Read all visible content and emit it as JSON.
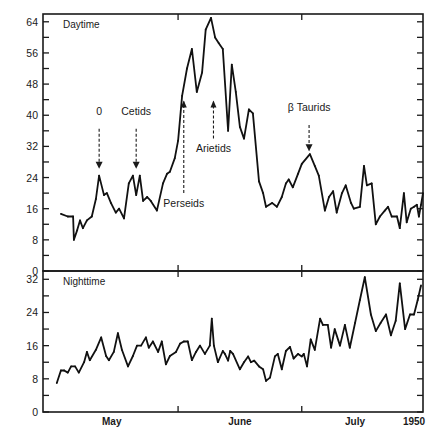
{
  "chart_data": [
    {
      "type": "line",
      "panel": "top",
      "title": "Daytime",
      "xlabel": "",
      "ylabel": "",
      "x_unit": "days from axis start",
      "xlim": [
        0,
        93.4
      ],
      "ylim": [
        0,
        66
      ],
      "yticks": [
        0,
        4,
        8,
        12,
        16,
        20,
        24,
        28,
        32,
        36,
        40,
        44,
        48,
        52,
        56,
        60,
        64
      ],
      "ytick_labels": [
        "0",
        "8",
        "16",
        "24",
        "32",
        "40",
        "48",
        "56",
        "64"
      ],
      "ytick_label_values": [
        0,
        8,
        16,
        24,
        32,
        40,
        48,
        56,
        64
      ],
      "month_ticks": [
        33.2,
        63.6
      ],
      "series": [
        {
          "name": "Daytime",
          "x": [
            4.4,
            6.1,
            7.4,
            7.6,
            8.4,
            9.1,
            9.8,
            10.8,
            12.0,
            13.0,
            13.8,
            15.0,
            15.7,
            16.7,
            17.9,
            18.7,
            19.9,
            21.1,
            22.1,
            22.9,
            23.8,
            24.6,
            25.6,
            26.5,
            28.0,
            29.5,
            30.5,
            31.2,
            32.4,
            33.2,
            34.2,
            35.4,
            36.6,
            37.8,
            39.1,
            40.0,
            41.3,
            42.3,
            43.2,
            44.2,
            45.5,
            46.4,
            47.4,
            48.4,
            49.4,
            50.6,
            51.6,
            53.1,
            54.1,
            54.8,
            56.3,
            57.5,
            58.7,
            59.7,
            60.4,
            61.4,
            62.7,
            63.6,
            65.6,
            66.8,
            67.8,
            69.3,
            70.3,
            71.3,
            72.2,
            73.5,
            74.4,
            75.7,
            76.4,
            77.9,
            78.9,
            79.6,
            80.8,
            81.8,
            82.8,
            84.0,
            84.8,
            85.7,
            87.0,
            87.7,
            88.7,
            89.4,
            90.4,
            91.2,
            91.9,
            92.4,
            92.9,
            93.4
          ],
          "values": [
            14.7,
            14,
            14,
            8,
            10.5,
            13,
            11,
            13,
            14,
            18.5,
            24.5,
            19.5,
            20,
            17.5,
            15,
            16,
            13.5,
            22.5,
            24.5,
            19.5,
            24.5,
            18,
            19,
            18,
            15.5,
            22.5,
            25,
            25.5,
            29,
            33.5,
            45,
            52,
            57,
            46,
            51,
            62,
            65,
            60,
            58.5,
            57,
            36,
            53,
            46,
            37,
            34,
            41.5,
            40.5,
            23,
            20,
            16.5,
            17.5,
            16.5,
            19,
            22.5,
            23.5,
            21.5,
            25,
            27.5,
            30,
            27,
            24.5,
            15.5,
            19,
            20.5,
            15,
            20,
            22,
            17.5,
            16,
            16.5,
            27,
            22,
            22.5,
            12,
            14,
            15.5,
            16.5,
            14,
            14,
            11,
            20,
            12.5,
            16,
            16.5,
            17,
            14,
            17,
            20
          ]
        }
      ],
      "annotations": [
        {
          "text": "0",
          "x": 13.8,
          "y_text": 40,
          "y_arrow_from": 36.5,
          "y_arrow_to": 26.5,
          "direction": "down"
        },
        {
          "text": "Cetids",
          "x": 22.9,
          "y_text": 40,
          "y_arrow_from": 36.5,
          "y_arrow_to": 26.5,
          "direction": "down"
        },
        {
          "text": "Perseids",
          "x": 34.6,
          "y_text": 16.5,
          "y_arrow_from": 20,
          "y_arrow_to": 43.5,
          "direction": "up"
        },
        {
          "text": "Arietids",
          "x": 41.9,
          "y_text": 30.5,
          "y_arrow_from": 34,
          "y_arrow_to": 43.5,
          "direction": "up"
        },
        {
          "text": "β Taurids",
          "x": 65.4,
          "y_text": 41,
          "y_arrow_from": 37.5,
          "y_arrow_to": 31,
          "direction": "down"
        }
      ]
    },
    {
      "type": "line",
      "panel": "bottom",
      "title": "Nighttime",
      "xlabel": "",
      "ylabel": "",
      "x_unit": "days from axis start",
      "xlim": [
        0,
        93.4
      ],
      "ylim": [
        0,
        34
      ],
      "yticks": [
        0,
        4,
        8,
        12,
        16,
        20,
        24,
        28,
        32
      ],
      "ytick_labels": [
        "0",
        "8",
        "16",
        "24",
        "32"
      ],
      "ytick_label_values": [
        0,
        8,
        16,
        24,
        32
      ],
      "month_ticks": [
        33.2,
        63.6
      ],
      "x_tick_labels": [
        {
          "text": "May",
          "x": 16.9
        },
        {
          "text": "June",
          "x": 48.4
        },
        {
          "text": "July",
          "x": 76.7
        },
        {
          "text": "1950",
          "x": 91.2
        }
      ],
      "series": [
        {
          "name": "Nighttime",
          "x": [
            3.4,
            4.4,
            5.2,
            6.1,
            6.9,
            7.9,
            8.8,
            10.1,
            10.8,
            11.5,
            13.0,
            14.3,
            15.5,
            16.2,
            17.4,
            18.4,
            19.4,
            20.9,
            22.1,
            23.1,
            24.1,
            25.3,
            26.0,
            27.0,
            28.3,
            29.2,
            30.2,
            31.2,
            32.7,
            33.7,
            34.6,
            35.6,
            36.6,
            37.6,
            38.6,
            39.8,
            41.0,
            41.5,
            42.0,
            43.0,
            44.2,
            44.7,
            45.5,
            46.0,
            46.7,
            48.4,
            49.4,
            50.4,
            51.1,
            51.9,
            53.1,
            54.1,
            54.8,
            55.8,
            57.0,
            57.7,
            58.7,
            59.7,
            60.7,
            61.6,
            62.7,
            63.6,
            64.1,
            64.9,
            65.8,
            66.8,
            68.1,
            68.8,
            70.0,
            70.8,
            71.7,
            73.0,
            74.2,
            75.4,
            76.7,
            77.9,
            79.1,
            80.6,
            81.8,
            83.0,
            84.3,
            85.5,
            86.7,
            87.7,
            89.0,
            90.2,
            91.2,
            92.1,
            92.9
          ],
          "values": [
            7,
            10,
            10,
            9.5,
            11,
            11,
            9.5,
            12,
            14.5,
            12.5,
            15,
            18,
            13.5,
            12.5,
            14.5,
            19,
            15,
            11,
            13.5,
            16,
            16,
            18,
            15.5,
            17,
            14.5,
            17,
            11.5,
            13.5,
            14.5,
            16.5,
            17,
            17,
            12.5,
            14.5,
            16,
            14,
            16,
            22.5,
            16,
            12,
            14.7,
            14,
            12.4,
            14.7,
            14,
            10.3,
            12,
            13.4,
            12,
            12.4,
            11,
            10.3,
            7.5,
            8.3,
            13.4,
            14,
            10.3,
            14.7,
            15.7,
            12.9,
            14,
            13.4,
            14,
            11,
            17.5,
            15,
            22.5,
            21,
            21,
            15.5,
            20,
            16,
            21,
            15.5,
            21.5,
            27,
            32.5,
            23.5,
            19.5,
            21.5,
            23.5,
            18.5,
            22,
            31,
            20,
            23.5,
            23.5,
            27,
            30.5
          ]
        }
      ]
    }
  ]
}
